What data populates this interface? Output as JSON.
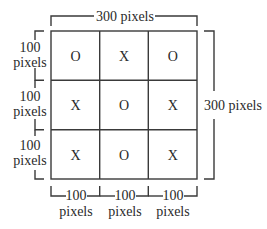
{
  "diagram": {
    "type": "tic-tac-toe grid dimensions",
    "top_label": "300 pixels",
    "right_label": "300 pixels",
    "row_labels": [
      {
        "value": "100",
        "unit": "pixels"
      },
      {
        "value": "100",
        "unit": "pixels"
      },
      {
        "value": "100",
        "unit": "pixels"
      }
    ],
    "column_labels": [
      {
        "value": "100",
        "unit": "pixels"
      },
      {
        "value": "100",
        "unit": "pixels"
      },
      {
        "value": "100",
        "unit": "pixels"
      }
    ],
    "grid": [
      [
        "O",
        "X",
        "O"
      ],
      [
        "X",
        "O",
        "X"
      ],
      [
        "X",
        "O",
        "X"
      ]
    ],
    "line_color": "#3a3a3a"
  }
}
